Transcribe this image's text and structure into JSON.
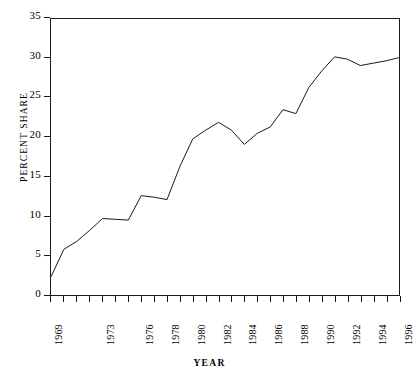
{
  "chart_data": {
    "type": "line",
    "title": "",
    "xlabel": "YEAR",
    "ylabel": "PERCENT SHARE",
    "xlim": [
      1969,
      1996
    ],
    "ylim": [
      0,
      35
    ],
    "grid": false,
    "legend": null,
    "line_color": "#1a1a1a",
    "x": [
      1969,
      1970,
      1971,
      1972,
      1973,
      1974,
      1975,
      1976,
      1977,
      1978,
      1979,
      1980,
      1981,
      1982,
      1983,
      1984,
      1985,
      1986,
      1987,
      1988,
      1989,
      1990,
      1991,
      1992,
      1993,
      1994,
      1995,
      1996
    ],
    "values": [
      2.3,
      5.8,
      6.8,
      8.2,
      9.7,
      9.6,
      9.5,
      12.6,
      12.4,
      12.1,
      16.3,
      19.8,
      20.9,
      21.9,
      20.9,
      19.1,
      20.5,
      21.3,
      23.5,
      23.0,
      26.3,
      28.4,
      30.2,
      29.9,
      29.1,
      29.4,
      29.7,
      30.1
    ],
    "y_ticks": [
      0,
      5,
      10,
      15,
      20,
      25,
      30,
      35
    ],
    "y_tick_labels": [
      "0",
      "5",
      "10",
      "15",
      "20",
      "25",
      "30",
      "35"
    ],
    "x_ticks": [
      1969,
      1970,
      1971,
      1972,
      1973,
      1974,
      1975,
      1976,
      1977,
      1978,
      1979,
      1980,
      1981,
      1982,
      1983,
      1984,
      1985,
      1986,
      1987,
      1988,
      1989,
      1990,
      1991,
      1992,
      1993,
      1994,
      1995,
      1996
    ],
    "x_tick_labels": [
      {
        "value": 1969,
        "label": "1969"
      },
      {
        "value": 1973,
        "label": "1973"
      },
      {
        "value": 1976,
        "label": "1976"
      },
      {
        "value": 1978,
        "label": "1978"
      },
      {
        "value": 1980,
        "label": "1980"
      },
      {
        "value": 1982,
        "label": "1982"
      },
      {
        "value": 1984,
        "label": "1984"
      },
      {
        "value": 1986,
        "label": "1986"
      },
      {
        "value": 1988,
        "label": "1988"
      },
      {
        "value": 1990,
        "label": "1990"
      },
      {
        "value": 1992,
        "label": "1992"
      },
      {
        "value": 1994,
        "label": "1994"
      },
      {
        "value": 1996,
        "label": "1996"
      }
    ]
  },
  "axis": {
    "y_title": "PERCENT SHARE",
    "x_title": "YEAR"
  }
}
